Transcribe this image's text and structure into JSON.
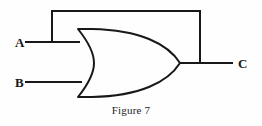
{
  "figure": {
    "caption": "Figure 7",
    "title": "Figure 7",
    "background_color": "#fefefe",
    "line_color": "#18181a",
    "line_width": 2
  },
  "labels": {
    "input_a": "A",
    "input_b": "B",
    "output_c": "C"
  },
  "gate": {
    "type": "OR",
    "inputs": [
      "A",
      "B"
    ],
    "output": "C"
  },
  "geometry": {
    "input_a_wire": "M 25 42 L 80 42",
    "input_b_wire": "M 25 82 L 82 82",
    "output_wire": "M 180 63 L 233 63",
    "feedback_wire": "M 52 42 L 52 11 L 200 11 L 200 63",
    "gate_body": "M 78 29 L 92 29 C 140 30 168 44 180 63 C 168 82 140 96 92 97 L 78 97 C 90 82 94 72 94 63 C 94 54 90 44 78 29 Z",
    "label_a_pos": [
      15,
      47
    ],
    "label_b_pos": [
      15,
      87
    ],
    "label_c_pos": [
      238,
      68
    ]
  }
}
